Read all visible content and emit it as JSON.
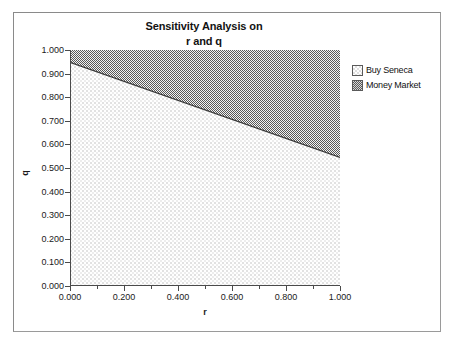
{
  "chart_data": {
    "type": "area",
    "title": "Sensitivity Analysis on r and q",
    "title_line1": "Sensitivity Analysis on",
    "title_line2": "r and q",
    "xlabel": "r",
    "ylabel": "q",
    "xlim": [
      0.0,
      1.0
    ],
    "ylim": [
      0.0,
      1.0
    ],
    "grid": false,
    "legend_position": "right",
    "x_ticks": [
      "0.000",
      "0.200",
      "0.400",
      "0.600",
      "0.800",
      "1.000"
    ],
    "x_tick_values": [
      0.0,
      0.2,
      0.4,
      0.6,
      0.8,
      1.0
    ],
    "x_minor_tick_values": [
      0.1,
      0.3,
      0.5,
      0.7,
      0.9
    ],
    "y_ticks": [
      "1.000",
      "0.900",
      "0.800",
      "0.700",
      "0.600",
      "0.500",
      "0.400",
      "0.300",
      "0.200",
      "0.100",
      "0.000"
    ],
    "y_tick_values": [
      1.0,
      0.9,
      0.8,
      0.7,
      0.6,
      0.5,
      0.4,
      0.3,
      0.2,
      0.1,
      0.0
    ],
    "boundary": {
      "name": "decision boundary",
      "x": [
        0.0,
        1.0
      ],
      "y": [
        0.948,
        0.545
      ]
    },
    "regions": [
      {
        "name": "Buy Seneca",
        "description": "region below the boundary line",
        "fill": "light-dotted",
        "color": "#efefef"
      },
      {
        "name": "Money Market",
        "description": "region above the boundary line",
        "fill": "dark-checker",
        "color": "#8f8f8f"
      }
    ],
    "series": [
      {
        "name": "Buy Seneca",
        "values": [
          0.948,
          0.545
        ]
      },
      {
        "name": "Money Market",
        "values": [
          0.052,
          0.455
        ]
      }
    ],
    "legend": [
      {
        "label": "Buy Seneca",
        "swatch": "light-dotted"
      },
      {
        "label": "Money Market",
        "swatch": "dark-checker"
      }
    ]
  }
}
